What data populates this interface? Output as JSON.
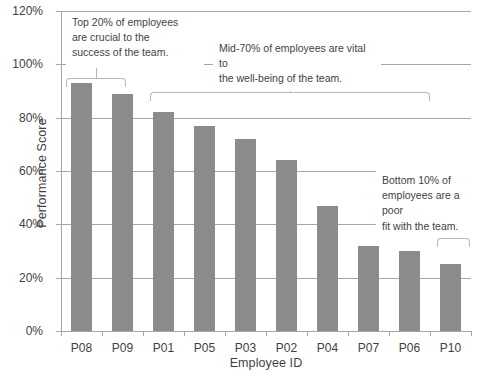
{
  "chart_data": {
    "type": "bar",
    "title": "",
    "xlabel": "Employee ID",
    "ylabel": "Performance Score",
    "categories": [
      "P08",
      "P09",
      "P01",
      "P05",
      "P03",
      "P02",
      "P04",
      "P07",
      "P06",
      "P10"
    ],
    "values": [
      93,
      89,
      82,
      77,
      72,
      64,
      47,
      32,
      30,
      25
    ],
    "ylim": [
      0,
      120
    ],
    "ytick_labels": [
      "0%",
      "20%",
      "40%",
      "60%",
      "80%",
      "100%",
      "120%"
    ],
    "ytick_values": [
      0,
      20,
      40,
      60,
      80,
      100,
      120
    ],
    "grid": true,
    "legend": "none",
    "bar_color": "#8b8b8b",
    "grid_color": "#a6a6a6",
    "annotations": [
      {
        "id": "top-20",
        "text": "Top 20% of employees are crucial to the success of the team.",
        "lines": [
          "Top 20% of employees",
          "are crucial to the",
          "success of the team."
        ],
        "covers": [
          "P08",
          "P09"
        ]
      },
      {
        "id": "mid-70",
        "text": "Mid-70% of employees are vital to the well-being of the team.",
        "lines": [
          "Mid-70% of employees are vital to",
          "the well-being of the team."
        ],
        "covers": [
          "P01",
          "P05",
          "P03",
          "P02",
          "P04",
          "P07",
          "P06"
        ]
      },
      {
        "id": "bottom-10",
        "text": "Bottom 10% of employees are a poor fit with the team.",
        "lines": [
          "Bottom 10% of",
          "employees are a poor",
          "fit with the team."
        ],
        "covers": [
          "P10"
        ]
      }
    ]
  }
}
